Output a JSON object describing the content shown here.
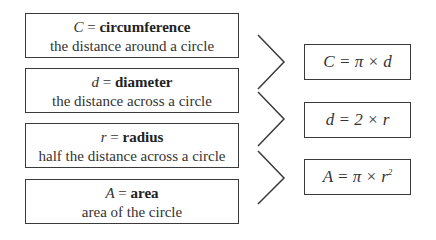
{
  "definitions": [
    {
      "symbol": "C",
      "equals": "=",
      "term": "circumference",
      "description": "the distance around a circle"
    },
    {
      "symbol": "d",
      "equals": "=",
      "term": "diameter",
      "description": "the distance across a circle"
    },
    {
      "symbol": "r",
      "equals": "=",
      "term": "radius",
      "description": "half the distance across a circle"
    },
    {
      "symbol": "A",
      "equals": "=",
      "term": "area",
      "description": "area of the circle"
    }
  ],
  "formulas": [
    {
      "text": "C = π × d",
      "exponent": ""
    },
    {
      "text": "d = 2 × r",
      "exponent": ""
    },
    {
      "text": "A = π × r",
      "exponent": "2"
    }
  ],
  "colors": {
    "border": "#3a3a3a",
    "text": "#333333"
  }
}
